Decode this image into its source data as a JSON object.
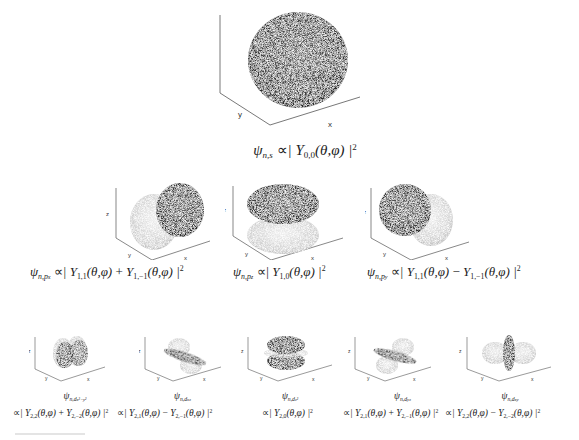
{
  "figure": {
    "axis_labels": {
      "x": "x",
      "y": "y",
      "z": "z"
    },
    "rows": [
      {
        "row": "s",
        "panels": [
          {
            "id": "s",
            "psi": "ψ",
            "psi_sub": "n,s",
            "relation": "∝",
            "expr": "| Y",
            "expr_sub1": "0,0",
            "expr_rest": "(θ,φ) |",
            "power": "2"
          }
        ]
      },
      {
        "row": "p",
        "panels": [
          {
            "id": "px",
            "psi": "ψ",
            "psi_sub": "n,p",
            "psi_subsub": "x",
            "relation": "∝",
            "term1": "| Y",
            "term1_sub": "1,1",
            "term1_args": "(θ,φ)",
            "op": " + ",
            "term2": "Y",
            "term2_sub": "1,−1",
            "term2_args": "(θ,φ) |",
            "power": "2"
          },
          {
            "id": "pz",
            "psi": "ψ",
            "psi_sub": "n,p",
            "psi_subsub": "z",
            "relation": "∝",
            "term1": "| Y",
            "term1_sub": "1,0",
            "term1_args": "(θ,φ) |",
            "power": "2"
          },
          {
            "id": "py",
            "psi": "ψ",
            "psi_sub": "n,p",
            "psi_subsub": "y",
            "relation": "∝",
            "term1": "| Y",
            "term1_sub": "1,1",
            "term1_args": "(θ,φ)",
            "op": " − ",
            "term2": "Y",
            "term2_sub": "1,−1",
            "term2_args": "(θ,φ) |",
            "power": "2"
          }
        ]
      },
      {
        "row": "d",
        "panels": [
          {
            "id": "dx2y2",
            "psi": "ψ",
            "psi_sub": "n,d",
            "psi_subsub": "x²−y²",
            "relation": "∝",
            "term1": "| Y",
            "term1_sub": "2,2",
            "term1_args": "(θ,φ)",
            "op": " + ",
            "term2": "Y",
            "term2_sub": "2,−2",
            "term2_args": "(θ,φ) |",
            "power": "2"
          },
          {
            "id": "dxz",
            "psi": "ψ",
            "psi_sub": "n,d",
            "psi_subsub": "xz",
            "relation": "∝",
            "term1": "| Y",
            "term1_sub": "2,1",
            "term1_args": "(θ,φ)",
            "op": " − ",
            "term2": "Y",
            "term2_sub": "2,−1",
            "term2_args": "(θ,φ) |",
            "power": "2"
          },
          {
            "id": "dz2",
            "psi": "ψ",
            "psi_sub": "n,d",
            "psi_subsub": "z²",
            "relation": "∝",
            "term1": "| Y",
            "term1_sub": "2,0",
            "term1_args": "(θ,φ) |",
            "power": "2"
          },
          {
            "id": "dyz",
            "psi": "ψ",
            "psi_sub": "n,d",
            "psi_subsub": "yz",
            "relation": "∝",
            "term1": "| Y",
            "term1_sub": "2,1",
            "term1_args": "(θ,φ)",
            "op": " + ",
            "term2": "Y",
            "term2_sub": "2,−1",
            "term2_args": "(θ,φ) |",
            "power": "2"
          },
          {
            "id": "dxy",
            "psi": "ψ",
            "psi_sub": "n,d",
            "psi_subsub": "xy",
            "relation": "∝",
            "term1": "| Y",
            "term1_sub": "2,2",
            "term1_args": "(θ,φ)",
            "op": " − ",
            "term2": "Y",
            "term2_sub": "2,−2",
            "term2_args": "(θ,φ) |",
            "power": "2"
          }
        ]
      }
    ]
  },
  "colors": {
    "dark_lobe": "#3a3a3a",
    "light_lobe": "#cfcfcf",
    "axis": "#555555",
    "background": "#ffffff"
  }
}
